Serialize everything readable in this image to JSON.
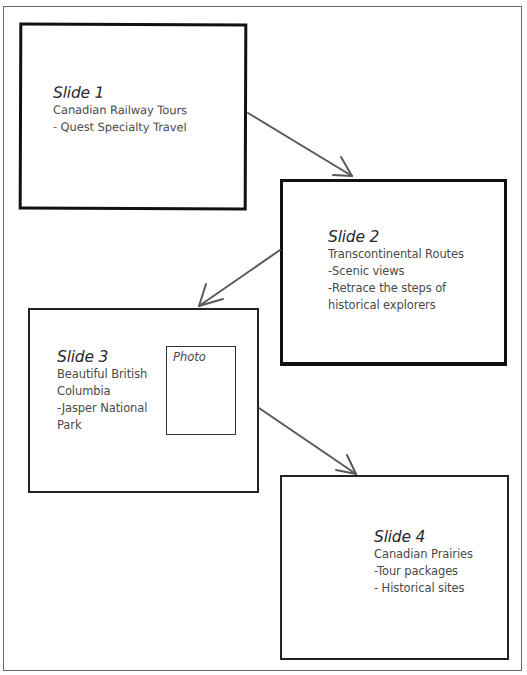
{
  "diagram": {
    "type": "storyboard",
    "colors": {
      "box_border": "#111111",
      "connector": "#5a5a5a",
      "text": "#4a4a4a",
      "frame": "#6a6a6a"
    },
    "slides": [
      {
        "title": "Slide 1",
        "lines": [
          "Canadian Railway Tours",
          "- Quest Specialty Travel"
        ]
      },
      {
        "title": "Slide 2",
        "lines": [
          "Transcontinental Routes",
          "-Scenic views",
          "-Retrace the steps of",
          "historical explorers"
        ]
      },
      {
        "title": "Slide 3",
        "lines": [
          "Beautiful British",
          "Columbia",
          "-Jasper National",
          "Park"
        ],
        "placeholder": "Photo"
      },
      {
        "title": "Slide 4",
        "lines": [
          "Canadian Prairies",
          "-Tour packages",
          "- Historical sites"
        ]
      }
    ],
    "connectors": [
      {
        "from": "Slide 1",
        "to": "Slide 2"
      },
      {
        "from": "Slide 2",
        "to": "Slide 3"
      },
      {
        "from": "Slide 3",
        "to": "Slide 4"
      }
    ]
  }
}
